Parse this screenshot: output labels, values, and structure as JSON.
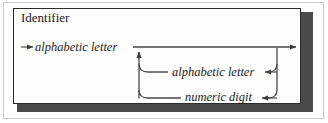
{
  "figure": {
    "kind": "syntax-railroad-diagram",
    "title": "Identifier",
    "colors": {
      "ink": "#1c1c1c",
      "rail": "#4a4a4a",
      "card_background": "#fdfdfc",
      "card_border": "#2b2b2b",
      "shadow": "#4a4a4a",
      "outer_frame": "#c9c9c9",
      "page_background": "#ffffff"
    },
    "rows": [
      {
        "id": "main",
        "label": "alphabetic letter",
        "role": "first-element",
        "entry_arrow": "arrow-right",
        "exit_arrow": "arrow-right"
      },
      {
        "id": "loop-letter",
        "label": "alphabetic letter",
        "role": "repeat-branch",
        "direction_arrow": "arrow-left"
      },
      {
        "id": "loop-digit",
        "label": "numeric digit",
        "role": "repeat-branch",
        "direction_arrow": "arrow-left"
      }
    ],
    "return_arrow": "arrow-up"
  }
}
